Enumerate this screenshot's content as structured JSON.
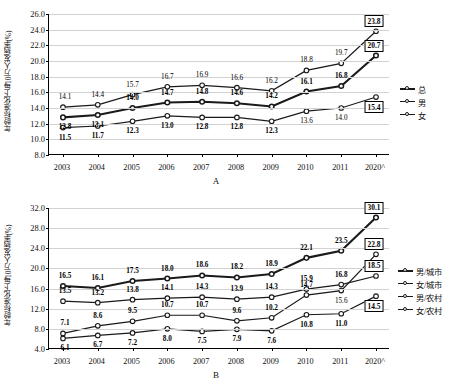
{
  "charts": {
    "a": {
      "letter": "A",
      "ylabel": "年龄标准化下每10万人发病率(%)",
      "yticks": [
        "8.0",
        "10.0",
        "12.0",
        "14.0",
        "16.0",
        "18.0",
        "20.0",
        "22.0",
        "24.0",
        "26.0"
      ],
      "xlabels": [
        "2003",
        "2004",
        "2005",
        "2006",
        "2007",
        "2008",
        "2009",
        "2010",
        "2011",
        "2020^"
      ],
      "legend": [
        "总",
        "男",
        "女"
      ]
    },
    "b": {
      "letter": "B",
      "ylabel": "年龄标准化下每10万人发病率(%)",
      "yticks": [
        "4.0",
        "8.0",
        "12.0",
        "16.0",
        "20.0",
        "24.0",
        "28.0",
        "32.0"
      ],
      "xlabels": [
        "2003",
        "2004",
        "2005",
        "2006",
        "2007",
        "2008",
        "2009",
        "2010",
        "2011",
        "2020^"
      ],
      "legend": [
        "男/城市",
        "女/城市",
        "男/农村",
        "女/农村"
      ]
    }
  },
  "chart_data": [
    {
      "type": "line",
      "panel": "A",
      "title": "",
      "xlabel": "",
      "ylabel": "年龄标准化下每10万人发病率(%)",
      "categories": [
        "2003",
        "2004",
        "2005",
        "2006",
        "2007",
        "2008",
        "2009",
        "2010",
        "2011",
        "2020^"
      ],
      "ylim": [
        8.0,
        26.0
      ],
      "ytick_step": 2.0,
      "grid": true,
      "legend_position": "right",
      "series": [
        {
          "name": "总",
          "emphasis": "bold",
          "values": [
            12.8,
            13.1,
            14.0,
            14.7,
            14.8,
            14.6,
            14.2,
            16.1,
            16.8,
            20.7
          ],
          "labels": [
            "12.8",
            "13.1",
            "14.0",
            "14.7",
            "14.8",
            "14.6",
            "14.2",
            "16.1",
            "16.8",
            "20.7"
          ],
          "label_style": [
            "bold",
            "bold",
            "bold",
            "bold",
            "bold",
            "bold",
            "bold",
            "bold",
            "bold",
            "boxed"
          ],
          "label_pos": [
            "below",
            "below",
            "above",
            "above",
            "above",
            "above",
            "above",
            "above",
            "above",
            "above"
          ]
        },
        {
          "name": "男",
          "emphasis": "normal",
          "values": [
            14.1,
            14.4,
            15.7,
            16.7,
            16.9,
            16.6,
            16.2,
            18.8,
            19.7,
            23.8
          ],
          "labels": [
            "14.1",
            "14.4",
            "15.7",
            "16.7",
            "16.9",
            "16.6",
            "16.2",
            "18.8",
            "19.7",
            "23.8"
          ],
          "label_style": [
            "plain",
            "plain",
            "plain",
            "plain",
            "plain",
            "plain",
            "plain",
            "plain",
            "plain",
            "boxed"
          ],
          "label_pos": [
            "above",
            "above",
            "above",
            "above",
            "above",
            "above",
            "above",
            "above",
            "above",
            "above"
          ]
        },
        {
          "name": "女",
          "emphasis": "normal",
          "values": [
            11.5,
            11.7,
            12.3,
            13.0,
            12.8,
            12.8,
            12.3,
            13.6,
            14.0,
            15.4
          ],
          "labels": [
            "11.5",
            "11.7",
            "12.3",
            "13.0",
            "12.8",
            "12.8",
            "12.3",
            "13.6",
            "14.0",
            "15.4"
          ],
          "label_style": [
            "bold",
            "bold",
            "bold",
            "bold",
            "bold",
            "bold",
            "bold",
            "plain",
            "plain",
            "boxed"
          ],
          "label_pos": [
            "below",
            "below",
            "below",
            "below",
            "below",
            "below",
            "below",
            "below",
            "below",
            "below"
          ]
        }
      ]
    },
    {
      "type": "line",
      "panel": "B",
      "title": "",
      "xlabel": "",
      "ylabel": "年龄标准化下每10万人发病率(%)",
      "categories": [
        "2003",
        "2004",
        "2005",
        "2006",
        "2007",
        "2008",
        "2009",
        "2010",
        "2011",
        "2020^"
      ],
      "ylim": [
        4.0,
        32.0
      ],
      "ytick_step": 4.0,
      "grid": true,
      "legend_position": "right",
      "series": [
        {
          "name": "男/城市",
          "emphasis": "bold",
          "values": [
            16.5,
            16.1,
            17.5,
            18.0,
            18.6,
            18.2,
            18.9,
            22.1,
            23.5,
            30.1
          ],
          "labels": [
            "16.5",
            "16.1",
            "17.5",
            "18.0",
            "18.6",
            "18.2",
            "18.9",
            "22.1",
            "23.5",
            "30.1"
          ],
          "label_style": [
            "bold",
            "bold",
            "bold",
            "bold",
            "bold",
            "bold",
            "bold",
            "bold",
            "bold",
            "boxed"
          ],
          "label_pos": [
            "above",
            "above",
            "above",
            "above",
            "above",
            "above",
            "above",
            "above",
            "above",
            "above"
          ]
        },
        {
          "name": "女/城市",
          "emphasis": "normal",
          "values": [
            13.5,
            13.2,
            13.8,
            14.1,
            14.3,
            13.9,
            14.3,
            15.9,
            16.8,
            18.5
          ],
          "labels": [
            "13.5",
            "13.2",
            "13.8",
            "14.1",
            "14.3",
            "13.9",
            "14.3",
            "15.9",
            "16.8",
            "18.5"
          ],
          "label_style": [
            "bold",
            "bold",
            "bold",
            "bold",
            "bold",
            "bold",
            "bold",
            "bold",
            "bold",
            "boxed"
          ],
          "label_pos": [
            "above",
            "above",
            "above",
            "above",
            "above",
            "above",
            "above",
            "above",
            "above",
            "above"
          ]
        },
        {
          "name": "男/农村",
          "emphasis": "normal",
          "values": [
            7.1,
            8.6,
            9.5,
            10.7,
            10.7,
            9.6,
            10.2,
            14.7,
            15.6,
            22.8
          ],
          "labels": [
            "7.1",
            "8.6",
            "9.5",
            "10.7",
            "10.7",
            "9.6",
            "10.2",
            "14.7",
            "15.6",
            "22.8"
          ],
          "label_style": [
            "bold",
            "bold",
            "bold",
            "bold",
            "bold",
            "bold",
            "bold",
            "bold",
            "plain",
            "boxed"
          ],
          "label_pos": [
            "above",
            "above",
            "above",
            "above",
            "above",
            "above",
            "above",
            "above",
            "below",
            "above"
          ]
        },
        {
          "name": "女/农村",
          "emphasis": "normal",
          "values": [
            6.1,
            6.7,
            7.2,
            8.0,
            7.5,
            7.9,
            7.6,
            10.8,
            11.0,
            14.5
          ],
          "labels": [
            "6.1",
            "6.7",
            "7.2",
            "8.0",
            "7.5",
            "7.9",
            "7.6",
            "10.8",
            "11.0",
            "14.5"
          ],
          "label_style": [
            "bold",
            "bold",
            "bold",
            "bold",
            "bold",
            "bold",
            "bold",
            "bold",
            "bold",
            "boxed"
          ],
          "label_pos": [
            "below",
            "below",
            "below",
            "below",
            "below",
            "below",
            "below",
            "below",
            "below",
            "below"
          ]
        }
      ]
    }
  ]
}
